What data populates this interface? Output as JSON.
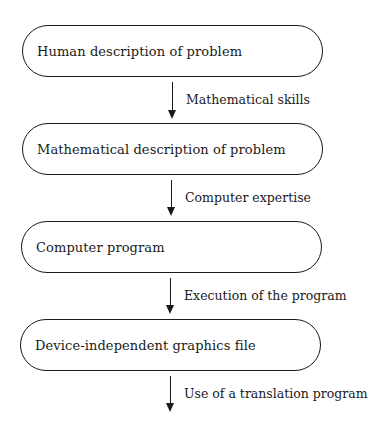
{
  "diagram": {
    "type": "flowchart",
    "direction": "top-to-bottom",
    "nodes": [
      {
        "id": "n1",
        "label": "Human description of problem"
      },
      {
        "id": "n2",
        "label": "Mathematical description of problem"
      },
      {
        "id": "n3",
        "label": "Computer program"
      },
      {
        "id": "n4",
        "label": "Device-independent graphics file"
      }
    ],
    "edges": [
      {
        "from": "n1",
        "to": "n2",
        "label": "Mathematical skills"
      },
      {
        "from": "n2",
        "to": "n3",
        "label": "Computer expertise"
      },
      {
        "from": "n3",
        "to": "n4",
        "label": "Execution of the program"
      },
      {
        "from": "n4",
        "to": null,
        "label": "Use of a translation program"
      }
    ]
  }
}
